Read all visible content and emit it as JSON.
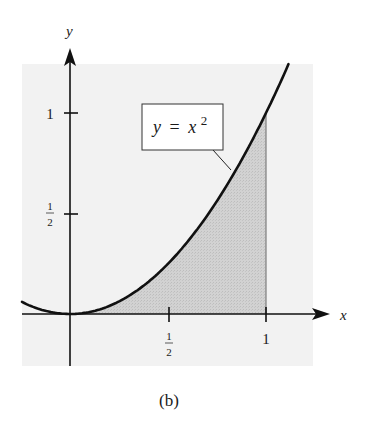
{
  "figure": {
    "caption": "(b)",
    "label_box": {
      "lhs": "y",
      "eq": "=",
      "base": "x",
      "exp": "2"
    },
    "axes": {
      "x_label": "x",
      "y_label": "y"
    },
    "ticks": {
      "x": [
        {
          "value": 0.5,
          "num": "1",
          "den": "2"
        },
        {
          "value": 1,
          "text": "1"
        }
      ],
      "y": [
        {
          "value": 0.5,
          "num": "1",
          "den": "2"
        },
        {
          "value": 1,
          "text": "1"
        }
      ]
    },
    "colors": {
      "panel_bg": "#f2f2f2",
      "shade": "#cfcfcf",
      "curve": "#111111",
      "axis": "#111111"
    }
  },
  "chart_data": {
    "type": "line",
    "title": "",
    "xlabel": "x",
    "ylabel": "y",
    "function": "y = x^2",
    "series": [
      {
        "name": "y = x^2",
        "x": [
          -0.25,
          0,
          0.25,
          0.5,
          0.75,
          1,
          1.115
        ],
        "values": [
          0.0625,
          0,
          0.0625,
          0.25,
          0.5625,
          1,
          1.243
        ]
      }
    ],
    "shaded_region": {
      "description": "area under y = x^2 from x = 0 to x = 1",
      "x_from": 0,
      "x_to": 1
    },
    "xticks": [
      "1/2",
      "1"
    ],
    "yticks": [
      "1/2",
      "1"
    ],
    "xlim": [
      -0.245,
      1.3
    ],
    "ylim": [
      -0.25,
      1.25
    ],
    "grid": false,
    "legend": "callout label box 'y = x^2' pointing to curve"
  }
}
